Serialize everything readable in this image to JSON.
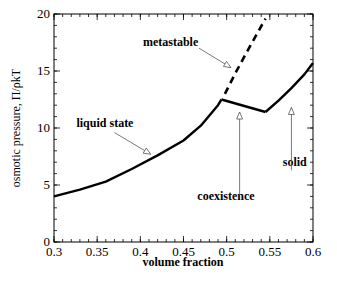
{
  "chart_data": {
    "type": "line",
    "title": "",
    "xlabel": "volume fraction",
    "ylabel": "osmotic pressure, Π/ρkT",
    "xlim": [
      0.3,
      0.6
    ],
    "ylim": [
      0,
      20
    ],
    "grid": false,
    "legend": null,
    "x_ticks": [
      0.3,
      0.35,
      0.4,
      0.45,
      0.5,
      0.55,
      0.6
    ],
    "x_tick_labels": [
      "0.3",
      "0.35",
      "0.4",
      "0.45",
      "0.5",
      "0.55",
      "0.6"
    ],
    "y_ticks": [
      0,
      5,
      10,
      15,
      20
    ],
    "y_tick_labels": [
      "0",
      "5",
      "10",
      "15",
      "20"
    ],
    "x_minor_step": 0.01,
    "y_minor_step": 1,
    "series": [
      {
        "name": "liquid state",
        "style": "solid",
        "x": [
          0.3,
          0.33,
          0.36,
          0.39,
          0.42,
          0.45,
          0.47,
          0.49,
          0.494
        ],
        "y": [
          4.0,
          4.6,
          5.3,
          6.4,
          7.6,
          8.9,
          10.2,
          12.0,
          12.5
        ]
      },
      {
        "name": "coexistence",
        "style": "solid",
        "x": [
          0.494,
          0.545
        ],
        "y": [
          12.5,
          11.4
        ]
      },
      {
        "name": "solid",
        "style": "solid",
        "x": [
          0.545,
          0.56,
          0.575,
          0.59,
          0.6
        ],
        "y": [
          11.4,
          12.4,
          13.5,
          14.7,
          15.7
        ]
      },
      {
        "name": "metastable",
        "style": "dashed",
        "x": [
          0.498,
          0.51,
          0.525,
          0.545
        ],
        "y": [
          13.0,
          14.8,
          16.9,
          19.6
        ]
      }
    ],
    "annotations": [
      {
        "text": "metastable",
        "text_x": 0.403,
        "text_y": 17.2,
        "arrow_from": [
          0.468,
          17.0
        ],
        "arrow_to": [
          0.505,
          15.3
        ],
        "arrow_dir": "diagonal"
      },
      {
        "text": "liquid state",
        "text_x": 0.326,
        "text_y": 10.1,
        "arrow_from": [
          0.37,
          9.6
        ],
        "arrow_to": [
          0.412,
          7.7
        ],
        "arrow_dir": "diagonal"
      },
      {
        "text": "coexistence",
        "text_x": 0.466,
        "text_y": 3.7,
        "arrow_from": [
          0.515,
          4.1
        ],
        "arrow_to": [
          0.515,
          11.4
        ],
        "arrow_dir": "up"
      },
      {
        "text": "solid",
        "text_x": 0.565,
        "text_y": 6.7,
        "arrow_from": [
          0.575,
          6.3
        ],
        "arrow_to": [
          0.575,
          11.8
        ],
        "arrow_dir": "up"
      }
    ]
  }
}
